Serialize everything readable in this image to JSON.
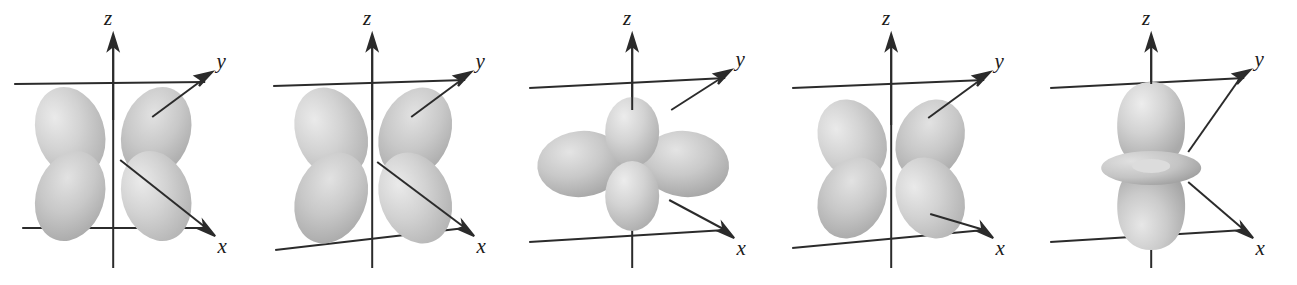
{
  "figure": {
    "background_color": "#ffffff",
    "line_color": "#2b2b2b",
    "lobe_fill_light": "#e4e4e4",
    "lobe_fill_mid": "#c9c9c9",
    "lobe_fill_dark": "#a8a8a8",
    "panel_count": 5
  },
  "axes": {
    "z_label": "z",
    "y_label": "y",
    "x_label": "x"
  },
  "panels": [
    {
      "id": "orbital-1",
      "orbital_name": "d-orbital-xz",
      "axis_labels": {
        "z": "z",
        "y": "y",
        "x": "x"
      },
      "lobe_count": 4,
      "lobe_orientation": "between-axes-vertical-pairs",
      "has_torus": false
    },
    {
      "id": "orbital-2",
      "orbital_name": "d-orbital-yz",
      "axis_labels": {
        "z": "z",
        "y": "y",
        "x": "x"
      },
      "lobe_count": 4,
      "lobe_orientation": "between-axes-vertical-pairs",
      "has_torus": false
    },
    {
      "id": "orbital-3",
      "orbital_name": "d-orbital-xy",
      "axis_labels": {
        "z": "z",
        "y": "y",
        "x": "x"
      },
      "lobe_count": 4,
      "lobe_orientation": "along-x-and-y-axes",
      "has_torus": false
    },
    {
      "id": "orbital-4",
      "orbital_name": "d-orbital-x2-y2",
      "axis_labels": {
        "z": "z",
        "y": "y",
        "x": "x"
      },
      "lobe_count": 4,
      "lobe_orientation": "between-axes-vertical-pairs",
      "has_torus": false
    },
    {
      "id": "orbital-5",
      "orbital_name": "d-orbital-z2",
      "axis_labels": {
        "z": "z",
        "y": "y",
        "x": "x"
      },
      "lobe_count": 2,
      "lobe_orientation": "along-z-axis-with-ring",
      "has_torus": true
    }
  ]
}
